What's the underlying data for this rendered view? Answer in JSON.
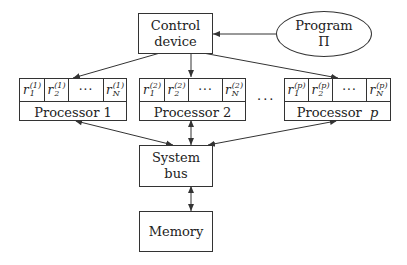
{
  "diagram": {
    "control_device": {
      "line1": "Control",
      "line2": "device"
    },
    "program": {
      "line1": "Program",
      "line2": "Π"
    },
    "processors": [
      {
        "label": "Processor",
        "index": "1",
        "superscript": "(1)",
        "registers": [
          {
            "base": "r",
            "sub": "1",
            "sup": "(1)"
          },
          {
            "base": "r",
            "sub": "2",
            "sup": "(1)"
          },
          {
            "dots": "···"
          },
          {
            "base": "r",
            "sub": "N",
            "sup": "(1)"
          }
        ]
      },
      {
        "label": "Processor",
        "index": "2",
        "superscript": "(2)",
        "registers": [
          {
            "base": "r",
            "sub": "1",
            "sup": "(2)"
          },
          {
            "base": "r",
            "sub": "2",
            "sup": "(2)"
          },
          {
            "dots": "···"
          },
          {
            "base": "r",
            "sub": "N",
            "sup": "(2)"
          }
        ]
      },
      {
        "label": "Processor",
        "index": "p",
        "superscript": "(p)",
        "registers": [
          {
            "base": "r",
            "sub": "1",
            "sup": "(p)"
          },
          {
            "base": "r",
            "sub": "2",
            "sup": "(p)"
          },
          {
            "dots": "···"
          },
          {
            "base": "r",
            "sub": "N",
            "sup": "(p)"
          }
        ]
      }
    ],
    "between_processors": "···",
    "system_bus": "System bus",
    "memory": "Memory",
    "colors": {
      "line": "#333333",
      "background": "#ffffff",
      "text": "#222222"
    }
  }
}
